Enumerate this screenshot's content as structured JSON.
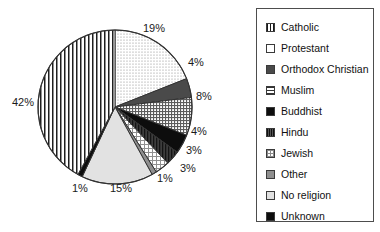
{
  "chart_data": {
    "type": "pie",
    "title": "",
    "legend_position": "right",
    "categories": [
      "Catholic",
      "Protestant",
      "Orthodox Christian",
      "Muslim",
      "Buddhist",
      "Hindu",
      "Jewish",
      "Other",
      "No religion",
      "Unknown"
    ],
    "values": [
      42,
      19,
      4,
      8,
      4,
      3,
      3,
      1,
      15,
      1
    ],
    "value_labels": [
      "42%",
      "19%",
      "4%",
      "8%",
      "4%",
      "3%",
      "3%",
      "1%",
      "15%",
      "1%"
    ],
    "unit": "%",
    "slice_order_clockwise_from_top": [
      "Protestant",
      "Orthodox Christian",
      "Muslim",
      "Buddhist",
      "Hindu",
      "Jewish",
      "Other",
      "No religion",
      "Unknown",
      "Catholic"
    ],
    "patterns": {
      "Catholic": "vertical-lines",
      "Protestant": "light-dots",
      "Orthodox Christian": "dark-gray-solid",
      "Muslim": "horizontal-grid",
      "Buddhist": "black-solid",
      "Hindu": "dark-textured",
      "Jewish": "light-crosshatch",
      "Other": "medium-gray-solid",
      "No religion": "light-gray-solid",
      "Unknown": "black-solid"
    }
  },
  "labels": [
    {
      "text": "19%",
      "left": 143,
      "top": 23
    },
    {
      "text": "4%",
      "left": 188,
      "top": 57
    },
    {
      "text": "8%",
      "left": 196,
      "top": 91
    },
    {
      "text": "4%",
      "left": 191,
      "top": 126
    },
    {
      "text": "3%",
      "left": 186,
      "top": 145
    },
    {
      "text": "3%",
      "left": 180,
      "top": 163
    },
    {
      "text": "1%",
      "left": 157,
      "top": 173
    },
    {
      "text": "15%",
      "left": 110,
      "top": 183
    },
    {
      "text": "1%",
      "left": 72,
      "top": 183
    },
    {
      "text": "42%",
      "left": 12,
      "top": 97
    }
  ],
  "legend": {
    "items": [
      {
        "label": "Catholic",
        "pattern": "p-vlines"
      },
      {
        "label": "Protestant",
        "pattern": "p-dots-light"
      },
      {
        "label": "Orthodox Christian",
        "pattern": "p-darkgray"
      },
      {
        "label": "Muslim",
        "pattern": "p-grid"
      },
      {
        "label": "Buddhist",
        "pattern": "p-black"
      },
      {
        "label": "Hindu",
        "pattern": "p-hindu"
      },
      {
        "label": "Jewish",
        "pattern": "p-crosshatch"
      },
      {
        "label": "Other",
        "pattern": "p-midgray"
      },
      {
        "label": "No religion",
        "pattern": "p-lightgray"
      },
      {
        "label": "Unknown",
        "pattern": "p-black"
      }
    ]
  },
  "colors": {
    "outline": "#333333",
    "legend_border": "#4d4d4d",
    "text": "#111111",
    "background": "#ffffff"
  }
}
